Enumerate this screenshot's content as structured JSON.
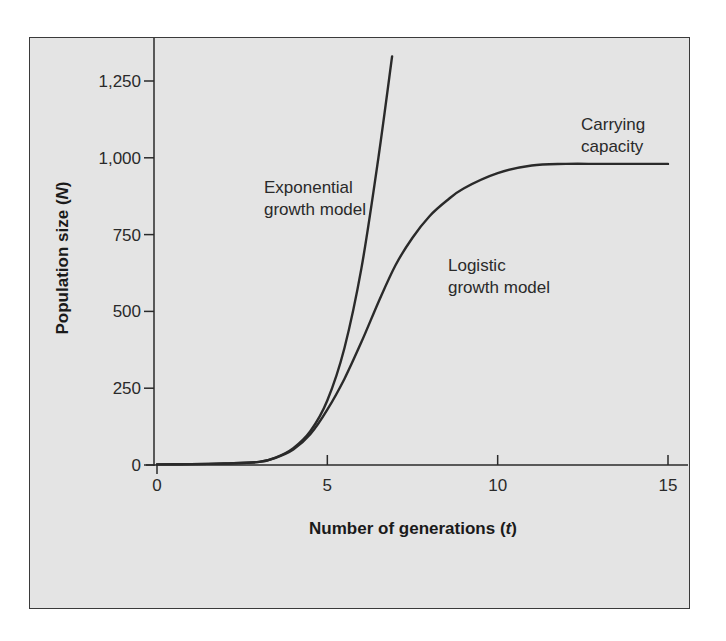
{
  "chart_data": {
    "type": "line",
    "title": "",
    "xlabel": "Number of generations (t)",
    "xlabel_main": "Number of generations (",
    "xlabel_var": "t",
    "xlabel_end": ")",
    "ylabel": "Population size (N)",
    "ylabel_main": "Population size (",
    "ylabel_var": "N",
    "ylabel_end": ")",
    "xlim": [
      0,
      15
    ],
    "ylim": [
      0,
      1250
    ],
    "x_ticks": [
      0,
      5,
      10,
      15
    ],
    "x_tick_labels": [
      "0",
      "5",
      "10",
      "15"
    ],
    "y_ticks": [
      0,
      250,
      500,
      750,
      1000,
      1250
    ],
    "y_tick_labels": [
      "0",
      "250",
      "500",
      "750",
      "1,000",
      "1,250"
    ],
    "grid": false,
    "legend": "none (inline annotations)",
    "series": [
      {
        "name": "Exponential growth model",
        "x": [
          0,
          1,
          2,
          3,
          3.5,
          4,
          4.5,
          5,
          5.5,
          6,
          6.5,
          6.9
        ],
        "y": [
          2,
          3,
          5,
          10,
          25,
          55,
          110,
          210,
          380,
          640,
          1000,
          1330
        ]
      },
      {
        "name": "Logistic growth model",
        "x": [
          0,
          1,
          2,
          3,
          3.5,
          4,
          4.5,
          5,
          5.5,
          6,
          6.5,
          7,
          7.5,
          8,
          8.5,
          9,
          10,
          11,
          12,
          13,
          14,
          15
        ],
        "y": [
          2,
          3,
          5,
          10,
          24,
          50,
          100,
          180,
          280,
          400,
          530,
          650,
          740,
          810,
          860,
          900,
          950,
          975,
          980,
          980,
          980,
          980
        ]
      }
    ],
    "annotations": [
      {
        "lines": [
          "Exponential",
          "growth model"
        ],
        "x": 3.2,
        "y": 1050
      },
      {
        "lines": [
          "Logistic",
          "growth model"
        ],
        "x": 7.9,
        "y": 640
      },
      {
        "lines": [
          "Carrying",
          "capacity"
        ],
        "x": 11.6,
        "y": 1130
      }
    ],
    "carrying_capacity": 980
  },
  "colors": {
    "plot_background": "#e4e4e4",
    "line": "#2a2a2a",
    "frame": "#3a3a3a"
  }
}
